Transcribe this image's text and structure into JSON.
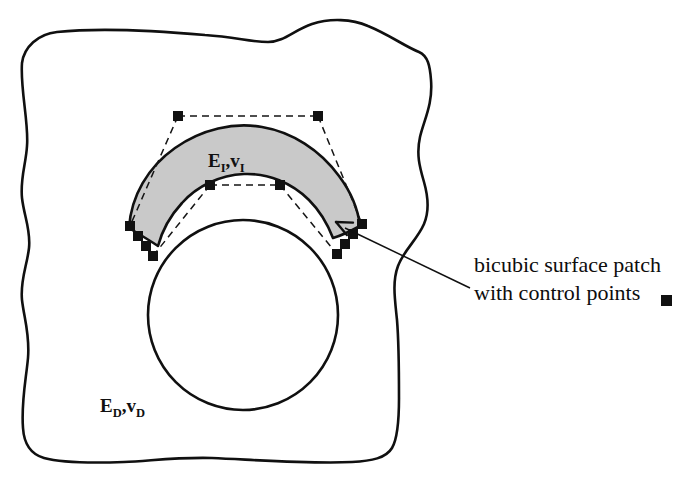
{
  "figure": {
    "caption_lines": [
      "bicubic surface patch",
      "with control points"
    ],
    "legend_marker": "filled-square",
    "labels": {
      "interphase": {
        "full": "EI,vI",
        "e_base": "E",
        "e_sub": "I",
        "comma": ",",
        "v_base": "v",
        "v_sub": "I"
      },
      "domain": {
        "full": "ED,vD",
        "e_base": "E",
        "e_sub": "D",
        "comma": ",",
        "v_base": "v",
        "v_sub": "D"
      }
    },
    "colors": {
      "outline": "#101010",
      "patch_fill": "#c9c9c9",
      "control_point": "#111111",
      "dashed_polygon": "#151515",
      "background": "#ffffff"
    },
    "geometry": {
      "outer_boundary_path": "M 22 63 C 24 47 38 34 57 32 C 105 27 160 31 205 35 C 236 37 250 42 268 42 C 284 42 294 30 312 24 C 330 18 352 19 368 26 C 390 35 404 46 419 52 C 428 56 430 66 431 80 C 433 104 424 120 420 137 C 416 155 420 168 424 182 C 428 196 430 210 424 224 C 417 240 404 250 398 266 C 392 282 395 300 397 320 C 399 344 399 372 399 398 C 399 420 398 438 392 448 C 386 458 372 461 352 462 C 310 464 258 460 212 458 C 176 457 150 461 124 462 C 96 463 62 463 44 458 C 30 454 24 444 23 428 C 21 402 26 380 28 358 C 30 334 24 318 22 300 C 20 280 27 266 29 248 C 31 230 24 216 22 198 C 20 178 26 164 27 146 C 29 124 20 88 22 63 Z",
      "hole_circle": {
        "cx": 243,
        "cy": 315,
        "r": 95
      },
      "patch_outer_path": "M 129 228 C 131 196 148 167 175 148 C 202 129 234 122 262 127 C 292 132 320 150 339 176 C 351 192 358 209 360 226 C 349 232 340 236 333 238 C 328 225 320 211 309 200 C 292 183 268 173 244 174 C 220 175 197 186 182 203 C 170 216 162 231 158 246 C 149 240 139 234 129 228 Z",
      "control_points": [
        {
          "x": 178,
          "y": 116,
          "name": "cp-top-left"
        },
        {
          "x": 318,
          "y": 116,
          "name": "cp-top-right"
        },
        {
          "x": 210,
          "y": 185,
          "name": "cp-mid-left"
        },
        {
          "x": 280,
          "y": 185,
          "name": "cp-mid-right"
        },
        {
          "x": 130,
          "y": 226,
          "name": "cp-left-1"
        },
        {
          "x": 138,
          "y": 236,
          "name": "cp-left-2"
        },
        {
          "x": 146,
          "y": 246,
          "name": "cp-left-3"
        },
        {
          "x": 153,
          "y": 256,
          "name": "cp-left-4"
        },
        {
          "x": 362,
          "y": 224,
          "name": "cp-right-1"
        },
        {
          "x": 353,
          "y": 234,
          "name": "cp-right-2"
        },
        {
          "x": 345,
          "y": 244,
          "name": "cp-right-3"
        },
        {
          "x": 337,
          "y": 254,
          "name": "cp-right-4"
        }
      ],
      "dashed_edges": [
        {
          "x1": 178,
          "y1": 116,
          "x2": 318,
          "y2": 116
        },
        {
          "x1": 210,
          "y1": 185,
          "x2": 280,
          "y2": 185
        },
        {
          "x1": 178,
          "y1": 116,
          "x2": 130,
          "y2": 226
        },
        {
          "x1": 318,
          "y1": 116,
          "x2": 362,
          "y2": 224
        },
        {
          "x1": 210,
          "y1": 185,
          "x2": 153,
          "y2": 256
        },
        {
          "x1": 280,
          "y1": 185,
          "x2": 337,
          "y2": 254
        }
      ],
      "leader_line": {
        "x1": 470,
        "y1": 288,
        "x2": 345,
        "y2": 228
      },
      "arrow_tip": {
        "x": 336,
        "y": 222
      },
      "interphase_label_pos": {
        "x": 208,
        "y": 167
      },
      "domain_label_pos": {
        "x": 100,
        "y": 412
      },
      "caption_pos": {
        "x": 474,
        "y": 272
      },
      "caption_line_height": 28,
      "legend_marker_pos": {
        "x": 661,
        "y": 295,
        "size": 11
      }
    }
  }
}
